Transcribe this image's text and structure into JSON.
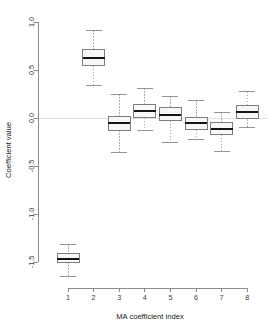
{
  "chart_data": {
    "type": "boxplot",
    "title": "",
    "xlabel": "MA coefficient index",
    "ylabel": "Coefficient value",
    "categories": [
      "1",
      "2",
      "3",
      "4",
      "5",
      "6",
      "7",
      "8"
    ],
    "xtick_labels": [
      "1",
      "2",
      "3",
      "4",
      "5",
      "6",
      "7",
      "8"
    ],
    "ytick_labels": [
      "1.0",
      "0.5",
      "0.0",
      "-0.5",
      "-1.0",
      "-1.5"
    ],
    "ytick_values": [
      1.0,
      0.5,
      0.0,
      -0.5,
      -1.0,
      -1.5
    ],
    "ylim": [
      -1.68,
      1.02
    ],
    "xlim": [
      0.4,
      8.6
    ],
    "grid": false,
    "legend": false,
    "zero_reference_line": 0.0,
    "boxes": [
      {
        "category": "1",
        "whisker_low": -1.65,
        "q1": -1.5,
        "median": -1.465,
        "q3": -1.415,
        "whisker_high": -1.315
      },
      {
        "category": "2",
        "whisker_low": 0.335,
        "q1": 0.545,
        "median": 0.625,
        "q3": 0.715,
        "whisker_high": 0.915
      },
      {
        "category": "3",
        "whisker_low": -0.355,
        "q1": -0.125,
        "median": -0.055,
        "q3": 0.015,
        "whisker_high": 0.245
      },
      {
        "category": "4",
        "whisker_low": -0.125,
        "q1": 0.005,
        "median": 0.07,
        "q3": 0.145,
        "whisker_high": 0.31
      },
      {
        "category": "5",
        "whisker_low": -0.255,
        "q1": -0.03,
        "median": 0.035,
        "q3": 0.105,
        "whisker_high": 0.225
      },
      {
        "category": "6",
        "whisker_low": -0.225,
        "q1": -0.12,
        "median": -0.05,
        "q3": 0.01,
        "whisker_high": 0.185
      },
      {
        "category": "7",
        "whisker_low": -0.35,
        "q1": -0.175,
        "median": -0.115,
        "q3": -0.05,
        "whisker_high": 0.06
      },
      {
        "category": "8",
        "whisker_low": -0.095,
        "q1": -0.01,
        "median": 0.06,
        "q3": 0.135,
        "whisker_high": 0.275
      }
    ],
    "colors": {
      "box_fill": "#f7f7f5",
      "box_border": "#6f6f6f",
      "median": "#141414",
      "whisker": "#9a9a9a",
      "axis": "#808080",
      "zero_line": "#d9d9d9",
      "text": "#3a3a3a",
      "background": "#ffffff"
    }
  }
}
